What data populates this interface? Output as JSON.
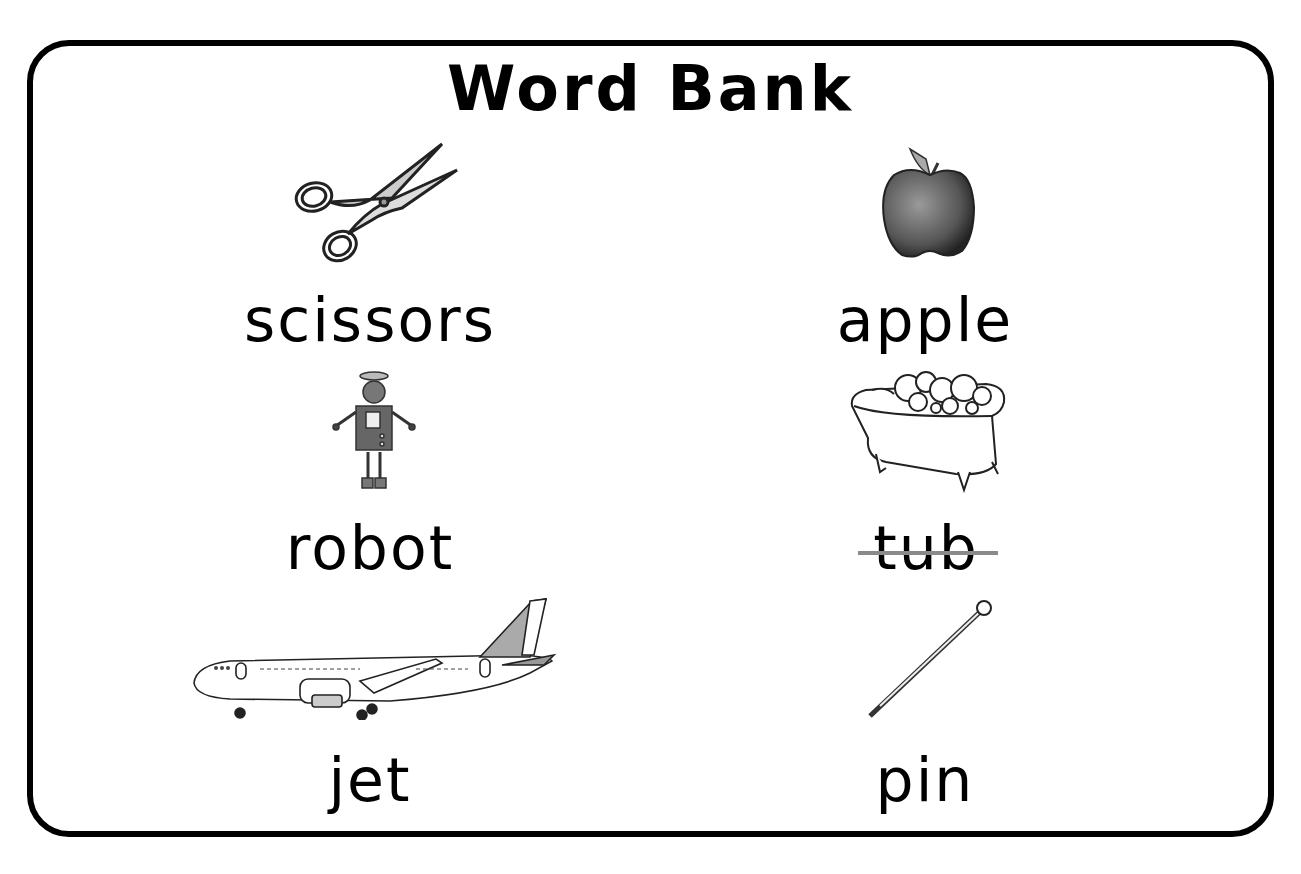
{
  "title": "Word Bank",
  "words": [
    {
      "label": "scissors",
      "icon": "scissors-icon",
      "crossed_out": false
    },
    {
      "label": "apple",
      "icon": "apple-icon",
      "crossed_out": false
    },
    {
      "label": "robot",
      "icon": "robot-icon",
      "crossed_out": false
    },
    {
      "label": "tub",
      "icon": "bathtub-icon",
      "crossed_out": true
    },
    {
      "label": "jet",
      "icon": "jet-icon",
      "crossed_out": false
    },
    {
      "label": "pin",
      "icon": "pin-icon",
      "crossed_out": false
    }
  ],
  "colors": {
    "border": "#000000",
    "strike": "#8a8a8a",
    "text": "#000000"
  }
}
